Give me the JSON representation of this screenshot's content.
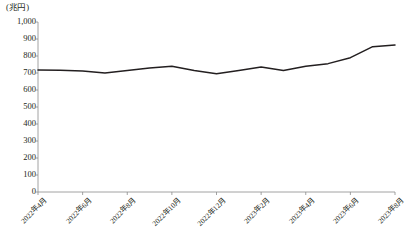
{
  "chart_data": {
    "type": "line",
    "title": "",
    "subtitle": "",
    "xlabel": "",
    "ylabel": "",
    "unit_label": "(兆円)",
    "ylim": [
      0,
      1000
    ],
    "ytick_step": 100,
    "ytick_labels": [
      "1,000",
      "900",
      "800",
      "700",
      "600",
      "500",
      "400",
      "300",
      "200",
      "100",
      "0"
    ],
    "ytick_values": [
      1000,
      900,
      800,
      700,
      600,
      500,
      400,
      300,
      200,
      100,
      0
    ],
    "grid": false,
    "legend": null,
    "legend_position": "none",
    "line_color": "#231f20",
    "axis_color": "#8c8c8c",
    "categories": [
      "2022年4月",
      "2022年5月",
      "2022年6月",
      "2022年7月",
      "2022年8月",
      "2022年9月",
      "2022年10月",
      "2022年11月",
      "2022年12月",
      "2023年1月",
      "2023年2月",
      "2023年3月",
      "2023年4月",
      "2023年5月",
      "2023年6月",
      "2023年7月",
      "2023年8月"
    ],
    "values": [
      718,
      716,
      712,
      700,
      715,
      730,
      740,
      715,
      695,
      715,
      735,
      715,
      740,
      755,
      790,
      855,
      865
    ],
    "xtick_labels": [
      "2022年4月",
      "2022年6月",
      "2022年8月",
      "2022年10月",
      "2022年12月",
      "2023年2月",
      "2023年4月",
      "2023年6月",
      "2023年8月"
    ],
    "xtick_indices": [
      0,
      2,
      4,
      6,
      8,
      10,
      12,
      14,
      16
    ]
  }
}
